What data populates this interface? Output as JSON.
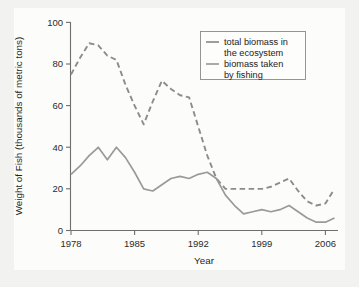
{
  "figure": {
    "background_color": "#f2f2f0",
    "plot_background_color": "#fcfcfb"
  },
  "chart_data": {
    "type": "line",
    "title": "",
    "xlabel": "Year",
    "ylabel": "Weight of Fish (thousands of metric tons)",
    "xlim": [
      1978,
      2007
    ],
    "ylim": [
      0,
      100
    ],
    "xticks": [
      "1978",
      "1985",
      "1992",
      "1999",
      "2006"
    ],
    "xtick_values": [
      1978,
      1985,
      1992,
      1999,
      2006
    ],
    "yticks": [
      "0",
      "20",
      "40",
      "60",
      "80",
      "100"
    ],
    "ytick_values": [
      0,
      20,
      40,
      60,
      80,
      100
    ],
    "grid": false,
    "legend_position": "top-right",
    "x": [
      1978,
      1979,
      1980,
      1981,
      1982,
      1983,
      1984,
      1985,
      1986,
      1987,
      1988,
      1989,
      1990,
      1991,
      1992,
      1993,
      1994,
      1995,
      1996,
      1997,
      1998,
      1999,
      2000,
      2001,
      2002,
      2003,
      2004,
      2005,
      2006,
      2007
    ],
    "series": [
      {
        "name": "total biomass in the ecosystem",
        "style": "dashed",
        "color": "#8c8c8c",
        "values": [
          75,
          83,
          90,
          89,
          84,
          82,
          70,
          60,
          51,
          62,
          72,
          68,
          65,
          64,
          50,
          36,
          25,
          20,
          20,
          20,
          20,
          20,
          21,
          23,
          25,
          19,
          14,
          12,
          13,
          20
        ]
      },
      {
        "name": "biomass taken by fishing",
        "style": "solid",
        "color": "#9a9a9a",
        "values": [
          27,
          31,
          36,
          40,
          34,
          40,
          35,
          28,
          20,
          19,
          22,
          25,
          26,
          25,
          27,
          28,
          25,
          17,
          12,
          8,
          9,
          10,
          9,
          10,
          12,
          9,
          6,
          4,
          4,
          6
        ]
      }
    ],
    "annotations": []
  },
  "legend": {
    "entries": [
      {
        "label_line1": "total biomass in",
        "label_line2": "the ecosystem"
      },
      {
        "label_line1": "biomass taken",
        "label_line2": "by fishing"
      }
    ]
  }
}
